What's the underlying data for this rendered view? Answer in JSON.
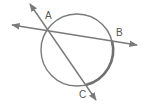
{
  "diagram": {
    "type": "circle with two secants from an exterior/on-circle point",
    "colors": {
      "stroke": "#7a7a7a",
      "arc_highlight": "#707070",
      "label": "#555555",
      "background": "#ffffff"
    },
    "circle": {
      "cx": 77,
      "cy": 50,
      "r": 36
    },
    "points": {
      "A": {
        "label": "A",
        "x": 47,
        "y": 31,
        "label_x": 45,
        "label_y": 19
      },
      "B": {
        "label": "B",
        "x": 112,
        "y": 41,
        "label_x": 116,
        "label_y": 36
      },
      "C": {
        "label": "C",
        "x": 86,
        "y": 85,
        "label_x": 79,
        "label_y": 98
      }
    },
    "lines": [
      {
        "name": "line-AB",
        "x1": 12,
        "y1": 25,
        "x2": 137,
        "y2": 45,
        "arrows": "both"
      },
      {
        "name": "line-AC",
        "x1": 30,
        "y1": 4,
        "x2": 96,
        "y2": 100,
        "arrows": "both"
      }
    ],
    "highlighted_arc": {
      "from": "B",
      "to": "C"
    }
  }
}
